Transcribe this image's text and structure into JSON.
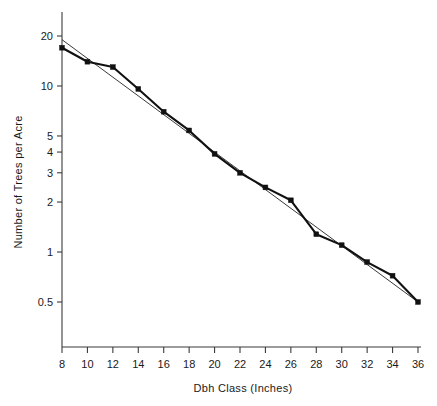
{
  "chart_data": {
    "type": "line",
    "title": "",
    "subtitle": "",
    "xlabel": "Dbh Class (Inches)",
    "ylabel": "Number of Trees per Acre",
    "yscale": "log",
    "xscale": "linear",
    "grid": false,
    "legend": "none",
    "xlim": [
      8,
      36
    ],
    "ylim": [
      0.42,
      24
    ],
    "x_ticks": [
      8,
      10,
      12,
      14,
      16,
      18,
      20,
      22,
      24,
      26,
      28,
      30,
      32,
      34,
      36
    ],
    "x_tick_labels": [
      "8",
      "10",
      "12",
      "14",
      "16",
      "18",
      "20",
      "22",
      "24",
      "26",
      "28",
      "30",
      "32",
      "34",
      "36"
    ],
    "y_ticks": [
      20,
      10,
      5,
      4,
      3,
      2,
      1,
      0.5
    ],
    "y_tick_labels": [
      "20",
      "10",
      "5",
      "4",
      "3",
      "2",
      "1",
      "0.5"
    ],
    "x": [
      8,
      10,
      12,
      14,
      16,
      18,
      20,
      22,
      24,
      26,
      28,
      30,
      32,
      34,
      36
    ],
    "series": [
      {
        "name": "Observed trees per acre",
        "style": "line-with-square-markers",
        "color": "#111111",
        "values": [
          17.0,
          14.0,
          13.0,
          9.6,
          7.0,
          5.4,
          3.9,
          3.0,
          2.45,
          2.05,
          1.28,
          1.1,
          0.87,
          0.72,
          0.5
        ]
      },
      {
        "name": "Fitted straight line",
        "style": "thin-line",
        "color": "#222222",
        "values": [
          19.0,
          16.35,
          14.06,
          12.1,
          10.41,
          8.95,
          7.7,
          6.63,
          5.7,
          4.9,
          4.22,
          3.63,
          3.12,
          2.68,
          0.5
        ],
        "endpoints": {
          "x_start": 8,
          "y_start": 19.0,
          "x_end": 36,
          "y_end": 0.5
        }
      }
    ]
  },
  "axes": {
    "x_title": "Dbh Class (Inches)",
    "y_title": "Number of Trees per Acre"
  }
}
